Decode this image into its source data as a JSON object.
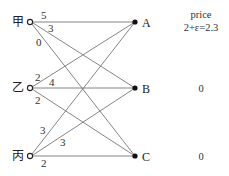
{
  "diagram": {
    "type": "bipartite-matching-market",
    "buyers": [
      {
        "id": "jia",
        "label": "甲",
        "x": 30,
        "y": 22
      },
      {
        "id": "yi",
        "label": "乙",
        "x": 30,
        "y": 88
      },
      {
        "id": "bing",
        "label": "丙",
        "x": 30,
        "y": 156
      }
    ],
    "sellers": [
      {
        "id": "A",
        "label": "A",
        "x": 135,
        "y": 22,
        "price": "2+ε=2.3"
      },
      {
        "id": "B",
        "label": "B",
        "x": 135,
        "y": 88,
        "price": "0"
      },
      {
        "id": "C",
        "label": "C",
        "x": 135,
        "y": 156,
        "price": "0"
      }
    ],
    "price_header": "price",
    "edges": [
      {
        "from": "jia",
        "to": "A",
        "valuation": "5"
      },
      {
        "from": "jia",
        "to": "B",
        "valuation": "3"
      },
      {
        "from": "jia",
        "to": "C",
        "valuation": "0"
      },
      {
        "from": "yi",
        "to": "A",
        "valuation": "2"
      },
      {
        "from": "yi",
        "to": "B",
        "valuation": "4"
      },
      {
        "from": "yi",
        "to": "C",
        "valuation": "2"
      },
      {
        "from": "bing",
        "to": "A",
        "valuation": "3"
      },
      {
        "from": "bing",
        "to": "B",
        "valuation": "3"
      },
      {
        "from": "bing",
        "to": "C",
        "valuation": "2"
      }
    ]
  }
}
